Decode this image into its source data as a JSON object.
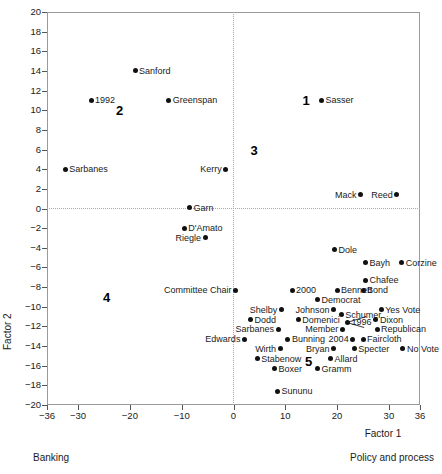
{
  "chart_data": {
    "type": "scatter",
    "title": "",
    "xlabel": "Factor 1",
    "ylabel": "Factor 2",
    "xlim": [
      -36,
      36
    ],
    "ylim": [
      -20,
      20
    ],
    "xticks": [
      -36,
      -30,
      -20,
      -10,
      0,
      10,
      20,
      30,
      36
    ],
    "yticks": [
      20,
      18,
      16,
      14,
      12,
      10,
      8,
      6,
      4,
      2,
      0,
      -2,
      -4,
      -6,
      -8,
      -10,
      -12,
      -14,
      -16,
      -18,
      -20
    ],
    "grid": false,
    "zero_reference_lines": true,
    "legend": "none",
    "caption_left": "Banking",
    "caption_right": "Policy and process",
    "quadrant_labels": [
      {
        "text": "1",
        "x": 14.0,
        "y": 11.0
      },
      {
        "text": "2",
        "x": -22.0,
        "y": 10.0
      },
      {
        "text": "3",
        "x": 4.0,
        "y": 6.0
      },
      {
        "text": "4",
        "x": -24.5,
        "y": -9.0
      },
      {
        "text": "5",
        "x": 14.5,
        "y": -15.5
      }
    ],
    "points": [
      {
        "label": "Sanford",
        "x": -19.0,
        "y": 14.0,
        "side": "right"
      },
      {
        "label": "1992",
        "x": -27.5,
        "y": 11.0,
        "side": "right"
      },
      {
        "label": "Greenspan",
        "x": -12.5,
        "y": 11.0,
        "side": "right"
      },
      {
        "label": "Sasser",
        "x": 17.0,
        "y": 11.0,
        "side": "right"
      },
      {
        "label": "Sarbanes",
        "x": -32.5,
        "y": 4.0,
        "side": "right"
      },
      {
        "label": "Kerry",
        "x": -1.5,
        "y": 4.0,
        "side": "left"
      },
      {
        "label": "Garn",
        "x": -8.5,
        "y": 0.1,
        "side": "right"
      },
      {
        "label": "Mack",
        "x": 24.5,
        "y": 1.4,
        "side": "left"
      },
      {
        "label": "Reed",
        "x": 31.5,
        "y": 1.4,
        "side": "left"
      },
      {
        "label": "D'Amato",
        "x": -9.5,
        "y": -2.0,
        "side": "right"
      },
      {
        "label": "Riegle",
        "x": -5.5,
        "y": -3.0,
        "side": "left"
      },
      {
        "label": "Dole",
        "x": 19.5,
        "y": -4.2,
        "side": "right"
      },
      {
        "label": "Bayh",
        "x": 25.5,
        "y": -5.5,
        "side": "right"
      },
      {
        "label": "Corzine",
        "x": 32.5,
        "y": -5.5,
        "side": "right"
      },
      {
        "label": "Chafee",
        "x": 25.5,
        "y": -7.3,
        "side": "right"
      },
      {
        "label": "Bennett",
        "x": 20.0,
        "y": -8.3,
        "side": "right"
      },
      {
        "label": "Bond",
        "x": 25.0,
        "y": -8.3,
        "side": "right"
      },
      {
        "label": "Committee Chair",
        "x": 0.4,
        "y": -8.3,
        "side": "left"
      },
      {
        "label": "2000",
        "x": 11.3,
        "y": -8.3,
        "side": "right"
      },
      {
        "label": "Democrat",
        "x": 16.2,
        "y": -9.3,
        "side": "right"
      },
      {
        "label": "Shelby",
        "x": 9.2,
        "y": -10.3,
        "side": "left"
      },
      {
        "label": "Johnson",
        "x": 19.3,
        "y": -10.3,
        "side": "left"
      },
      {
        "label": "Schumer",
        "x": 20.8,
        "y": -10.8,
        "side": "right"
      },
      {
        "label": "Yes Vote",
        "x": 28.5,
        "y": -10.3,
        "side": "right"
      },
      {
        "label": "Dodd",
        "x": 3.3,
        "y": -11.3,
        "side": "right"
      },
      {
        "label": "Domenici",
        "x": 12.5,
        "y": -11.3,
        "side": "right"
      },
      {
        "label": "1996",
        "x": 22.0,
        "y": -11.6,
        "side": "right"
      },
      {
        "label": "Dixon",
        "x": 27.5,
        "y": -11.3,
        "side": "right"
      },
      {
        "label": "Sarbanes",
        "x": 8.6,
        "y": -12.3,
        "side": "left"
      },
      {
        "label": "Member",
        "x": 21.0,
        "y": -12.3,
        "side": "left"
      },
      {
        "label": "Republican",
        "x": 27.7,
        "y": -12.3,
        "side": "right"
      },
      {
        "label": "Edwards",
        "x": 2.1,
        "y": -13.3,
        "side": "left"
      },
      {
        "label": "Bunning",
        "x": 10.5,
        "y": -13.3,
        "side": "right"
      },
      {
        "label": "2004",
        "x": 23.0,
        "y": -13.3,
        "side": "left"
      },
      {
        "label": "Faircloth",
        "x": 25.0,
        "y": -13.3,
        "side": "right"
      },
      {
        "label": "Wirth",
        "x": 9.0,
        "y": -14.3,
        "side": "left"
      },
      {
        "label": "Bryan",
        "x": 19.3,
        "y": -14.3,
        "side": "left"
      },
      {
        "label": "Specter",
        "x": 23.3,
        "y": -14.3,
        "side": "right"
      },
      {
        "label": "No Vote",
        "x": 32.7,
        "y": -14.3,
        "side": "right"
      },
      {
        "label": "Stabenow",
        "x": 4.6,
        "y": -15.3,
        "side": "right"
      },
      {
        "label": "Allard",
        "x": 18.7,
        "y": -15.3,
        "side": "right"
      },
      {
        "label": "Boxer",
        "x": 7.9,
        "y": -16.3,
        "side": "right"
      },
      {
        "label": "Gramm",
        "x": 16.2,
        "y": -16.3,
        "side": "right"
      },
      {
        "label": "Sununu",
        "x": 8.5,
        "y": -18.6,
        "side": "right"
      }
    ],
    "leaders": [
      {
        "from": [
          22.0,
          -11.6
        ],
        "to": [
          25.6,
          -11.0
        ]
      },
      {
        "from": [
          22.0,
          -11.6
        ],
        "to": [
          25.3,
          -12.1
        ]
      }
    ]
  }
}
